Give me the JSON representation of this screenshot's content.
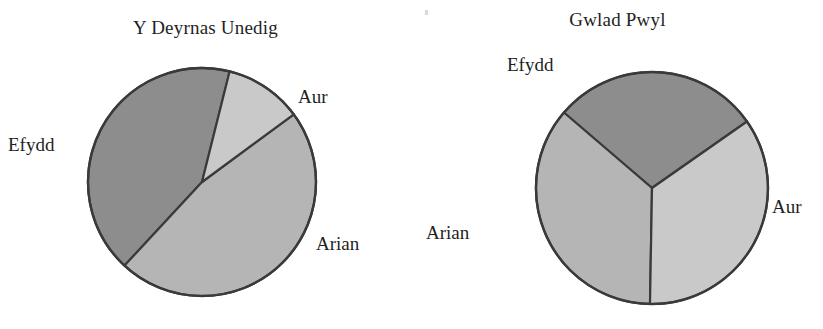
{
  "figure": {
    "background_color": "#ffffff",
    "outline_color": "#3a3a3a",
    "speck_mark": ""
  },
  "palette": {
    "aur": "#c9c9c9",
    "arian": "#b5b5b5",
    "efydd": "#8d8d8d",
    "outline": "#3a3a3a"
  },
  "charts": [
    {
      "id": "uk",
      "title": "Y Deyrnas Unedig",
      "center": {
        "x": 202,
        "y": 182
      },
      "radius": 114,
      "labels": {
        "aur": "Aur",
        "arian": "Arian",
        "efydd": "Efydd"
      }
    },
    {
      "id": "pl",
      "title": "Gwlad Pwyl",
      "center": {
        "x": 240,
        "y": 188
      },
      "radius": 116,
      "labels": {
        "aur": "Aur",
        "arian": "Arian",
        "efydd": "Efydd"
      }
    }
  ],
  "chart_data": [
    {
      "type": "pie",
      "title": "Y Deyrnas Unedig",
      "categories": [
        "Aur",
        "Arian",
        "Efydd"
      ],
      "values": [
        11,
        47,
        42
      ],
      "unit": "percent",
      "colors": [
        "#c9c9c9",
        "#b5b5b5",
        "#8d8d8d"
      ],
      "start_angle_deg": -76,
      "direction": "clockwise",
      "legend": "labels placed outside slices",
      "slice_angles_deg": [
        40,
        169,
        151
      ],
      "labels_shown": [
        "Aur",
        "Arian",
        "Efydd"
      ]
    },
    {
      "type": "pie",
      "title": "Gwlad Pwyl",
      "categories": [
        "Aur",
        "Arian",
        "Efydd"
      ],
      "values": [
        35,
        36,
        29
      ],
      "unit": "percent",
      "colors": [
        "#c9c9c9",
        "#b5b5b5",
        "#8d8d8d"
      ],
      "start_angle_deg": -35,
      "direction": "clockwise",
      "legend": "labels placed outside slices",
      "slice_angles_deg": [
        126,
        130,
        104
      ],
      "labels_shown": [
        "Aur",
        "Arian",
        "Efydd"
      ]
    }
  ]
}
